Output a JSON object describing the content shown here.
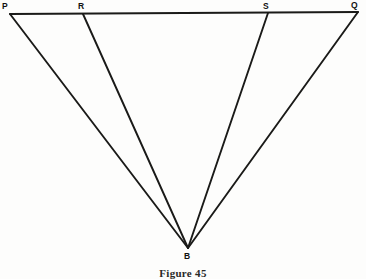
{
  "figure": {
    "caption": "Figure 45",
    "background_color": "#fdfdfc",
    "ink_color": "#1a1a18",
    "labels": {
      "P": "P",
      "R": "R",
      "S": "S",
      "Q": "Q",
      "B": "B"
    },
    "points": {
      "P": {
        "x": 10,
        "y": 14
      },
      "R": {
        "x": 83,
        "y": 14
      },
      "S": {
        "x": 268,
        "y": 13
      },
      "Q": {
        "x": 358,
        "y": 12
      },
      "B": {
        "x": 188,
        "y": 248
      }
    },
    "segments": [
      {
        "name": "PQ",
        "from": "P",
        "to": "Q"
      },
      {
        "name": "PB",
        "from": "P",
        "to": "B"
      },
      {
        "name": "RB",
        "from": "R",
        "to": "B"
      },
      {
        "name": "SB",
        "from": "S",
        "to": "B"
      },
      {
        "name": "QB",
        "from": "Q",
        "to": "B"
      }
    ]
  }
}
